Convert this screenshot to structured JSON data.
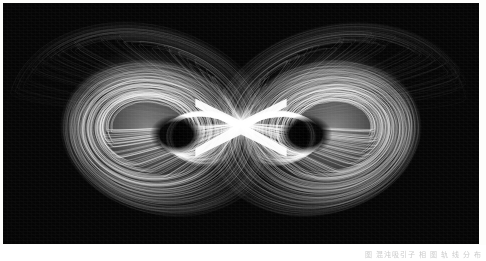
{
  "figure": {
    "kind": "butterfly double-lobe strange attractor",
    "render_style": "white trajectory lines on black background",
    "caption_watermark": "图 混沌吸引子 相 图 轨 线 分 布",
    "colors": {
      "background_paper": "#fdfdfb",
      "plot_background": "#050505",
      "trajectory": "#ffffff",
      "trajectory_dim": "#9a9a9a"
    },
    "plate": {
      "x": 3,
      "y": 3,
      "width": 476,
      "height": 241
    }
  },
  "chart_data": {
    "type": "scatter",
    "title": "",
    "xlabel": "",
    "ylabel": "",
    "grid": false,
    "legend": null,
    "xlim": [
      -1.0,
      1.0
    ],
    "ylim": [
      -0.55,
      0.55
    ],
    "structure": {
      "lobes": 2,
      "symmetry": "mirror about vertical axis x = 0",
      "crossing_point": [
        0.0,
        0.0
      ],
      "lobe_centers": [
        [
          -0.44,
          0.02
        ],
        [
          0.44,
          0.02
        ]
      ],
      "lobe_void_centers": [
        [
          -0.3,
          0.06
        ],
        [
          0.3,
          0.06
        ]
      ],
      "lobe_void_radius": 0.085,
      "outer_extent_x": [
        -0.9,
        0.9
      ],
      "outer_extent_y": [
        -0.46,
        0.46
      ]
    },
    "series": [
      {
        "name": "trajectory bundle (left lobe)",
        "stroke": "#ffffff",
        "count": 150
      },
      {
        "name": "trajectory bundle (right lobe)",
        "stroke": "#ffffff",
        "count": 150
      },
      {
        "name": "central crossing filaments",
        "stroke": "#ffffff",
        "count": 40
      }
    ],
    "x": [
      -0.9,
      -0.72,
      -0.55,
      -0.44,
      -0.3,
      -0.16,
      0.0,
      0.16,
      0.3,
      0.44,
      0.55,
      0.72,
      0.9
    ],
    "values": [
      0.1,
      0.3,
      0.42,
      0.46,
      0.4,
      0.22,
      0.02,
      0.22,
      0.4,
      0.46,
      0.42,
      0.3,
      0.1
    ]
  }
}
